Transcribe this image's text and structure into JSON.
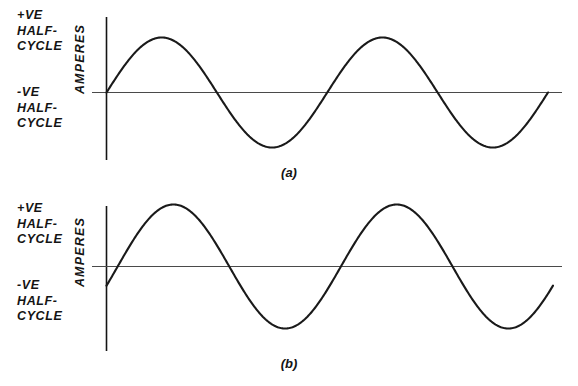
{
  "figure": {
    "background_color": "#ffffff",
    "ink_color": "#141414"
  },
  "panels": [
    {
      "id": "a",
      "caption": "(a)",
      "positive_label": "+VE\nHALF-\nCYCLE",
      "negative_label": "-VE\nHALF-\nCYCLE",
      "axis_label": "AMPERES"
    },
    {
      "id": "b",
      "caption": "(b)",
      "positive_label": "+VE\nHALF-\nCYCLE",
      "negative_label": "-VE\nHALF-\nCYCLE",
      "axis_label": "AMPERES"
    }
  ],
  "chart_data": [
    {
      "type": "line",
      "id": "a",
      "title": "(a)",
      "xlabel": "",
      "ylabel": "AMPERES",
      "grid": false,
      "legend": "none",
      "annotations": [
        "+VE HALF-CYCLE",
        "-VE HALF-CYCLE"
      ],
      "waveform": "sine",
      "cycles": 2,
      "amplitude": 1.0,
      "phase_degrees": 0,
      "xlim": [
        0,
        2
      ],
      "ylim": [
        -1.25,
        1.25
      ],
      "x": [
        0,
        0.125,
        0.25,
        0.375,
        0.5,
        0.625,
        0.75,
        0.875,
        1.0,
        1.125,
        1.25,
        1.375,
        1.5,
        1.625,
        1.75,
        1.875,
        2.0
      ],
      "y": [
        0,
        0.707,
        1.0,
        0.707,
        0,
        -0.707,
        -1.0,
        -0.707,
        0,
        0.707,
        1.0,
        0.707,
        0,
        -0.707,
        -1.0,
        -0.707,
        0
      ]
    },
    {
      "type": "line",
      "id": "b",
      "title": "(b)",
      "xlabel": "",
      "ylabel": "AMPERES",
      "grid": false,
      "legend": "none",
      "annotations": [
        "+VE HALF-CYCLE",
        "-VE HALF-CYCLE"
      ],
      "waveform": "sine",
      "cycles": 2,
      "amplitude": 1.0,
      "phase_degrees": -18,
      "xlim": [
        0,
        2
      ],
      "ylim": [
        -1.25,
        1.25
      ],
      "x": [
        0,
        0.125,
        0.25,
        0.375,
        0.5,
        0.625,
        0.75,
        0.875,
        1.0,
        1.125,
        1.25,
        1.375,
        1.5,
        1.625,
        1.75,
        1.875,
        2.0
      ],
      "y": [
        -0.309,
        0.454,
        0.891,
        0.988,
        0.309,
        -0.454,
        -0.891,
        -0.988,
        -0.309,
        0.454,
        0.891,
        0.988,
        0.309,
        -0.454,
        -0.891,
        -0.988,
        -0.309
      ]
    }
  ]
}
